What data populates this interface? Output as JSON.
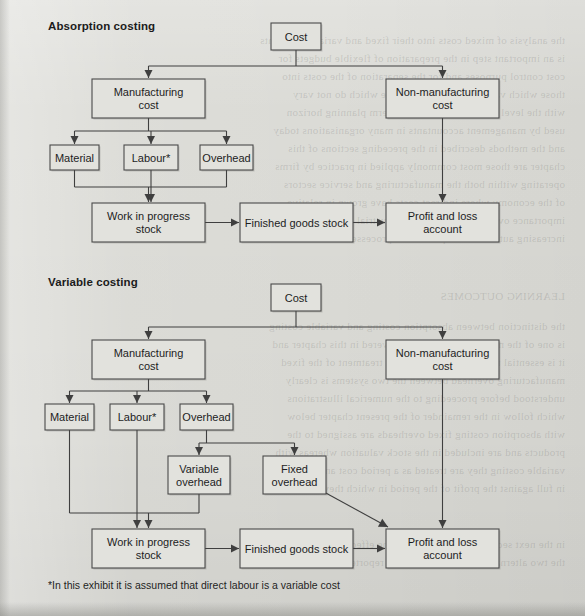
{
  "page": {
    "width": 585,
    "height": 616,
    "background_color": "#dbdbd6",
    "box_fill_color": "#e2e2dd",
    "box_stroke_color": "#4a4a4a",
    "text_color": "#1d1d1d"
  },
  "sections": {
    "absorption": {
      "title": "Absorption costing",
      "title_pos": {
        "x": 48,
        "y": 31
      }
    },
    "variable": {
      "title": "Variable costing",
      "title_pos": {
        "x": 48,
        "y": 287
      }
    }
  },
  "footnote": {
    "text": "*In this exhibit it is assumed that direct labour is a variable cost",
    "pos": {
      "x": 48,
      "y": 590
    }
  },
  "diagram": {
    "absorption_nodes": [
      {
        "id": "abs-cost",
        "label": "Cost",
        "lines": [
          "Cost"
        ],
        "x": 271,
        "y": 23,
        "w": 50,
        "h": 27
      },
      {
        "id": "abs-manufacturing",
        "label": "Manufacturing cost",
        "lines": [
          "Manufacturing",
          "cost"
        ],
        "x": 92,
        "y": 79,
        "w": 113,
        "h": 39
      },
      {
        "id": "abs-nonmanufacturing",
        "label": "Non-manufacturing cost",
        "lines": [
          "Non-manufacturing",
          "cost"
        ],
        "x": 386,
        "y": 79,
        "w": 113,
        "h": 39
      },
      {
        "id": "abs-material",
        "label": "Material",
        "lines": [
          "Material"
        ],
        "x": 50,
        "y": 145,
        "w": 49,
        "h": 25
      },
      {
        "id": "abs-labour",
        "label": "Labour*",
        "lines": [
          "Labour*"
        ],
        "x": 124,
        "y": 145,
        "w": 54,
        "h": 25
      },
      {
        "id": "abs-overhead",
        "label": "Overhead",
        "lines": [
          "Overhead"
        ],
        "x": 200,
        "y": 145,
        "w": 53,
        "h": 25
      },
      {
        "id": "abs-wip",
        "label": "Work in progress stock",
        "lines": [
          "Work in progress",
          "stock"
        ],
        "x": 92,
        "y": 203,
        "w": 113,
        "h": 39
      },
      {
        "id": "abs-finished",
        "label": "Finished goods stock",
        "lines": [
          "Finished goods stock"
        ],
        "x": 240,
        "y": 203,
        "w": 113,
        "h": 39
      },
      {
        "id": "abs-profitloss",
        "label": "Profit and loss account",
        "lines": [
          "Profit and loss",
          "account"
        ],
        "x": 386,
        "y": 203,
        "w": 113,
        "h": 39
      }
    ],
    "variable_nodes": [
      {
        "id": "var-cost",
        "label": "Cost",
        "lines": [
          "Cost"
        ],
        "x": 271,
        "y": 284,
        "w": 50,
        "h": 27
      },
      {
        "id": "var-manufacturing",
        "label": "Manufacturing cost",
        "lines": [
          "Manufacturing",
          "cost"
        ],
        "x": 92,
        "y": 340,
        "w": 113,
        "h": 39
      },
      {
        "id": "var-nonmanufacturing",
        "label": "Non-manufacturing cost",
        "lines": [
          "Non-manufacturing",
          "cost"
        ],
        "x": 386,
        "y": 340,
        "w": 113,
        "h": 39
      },
      {
        "id": "var-material",
        "label": "Material",
        "lines": [
          "Material"
        ],
        "x": 45,
        "y": 404,
        "w": 49,
        "h": 26
      },
      {
        "id": "var-labour",
        "label": "Labour*",
        "lines": [
          "Labour*"
        ],
        "x": 110,
        "y": 404,
        "w": 54,
        "h": 26
      },
      {
        "id": "var-overhead",
        "label": "Overhead",
        "lines": [
          "Overhead"
        ],
        "x": 180,
        "y": 404,
        "w": 53,
        "h": 26
      },
      {
        "id": "var-variable-oh",
        "label": "Variable overhead",
        "lines": [
          "Variable",
          "overhead"
        ],
        "x": 168,
        "y": 456,
        "w": 62,
        "h": 38
      },
      {
        "id": "var-fixed-oh",
        "label": "Fixed overhead",
        "lines": [
          "Fixed",
          "overhead"
        ],
        "x": 263,
        "y": 456,
        "w": 63,
        "h": 38
      },
      {
        "id": "var-wip",
        "label": "Work in progress stock",
        "lines": [
          "Work in progress",
          "stock"
        ],
        "x": 92,
        "y": 529,
        "w": 113,
        "h": 39
      },
      {
        "id": "var-finished",
        "label": "Finished goods stock",
        "lines": [
          "Finished goods stock"
        ],
        "x": 240,
        "y": 529,
        "w": 113,
        "h": 39
      },
      {
        "id": "var-profitloss",
        "label": "Profit and loss account",
        "lines": [
          "Profit and loss",
          "account"
        ],
        "x": 386,
        "y": 529,
        "w": 113,
        "h": 39
      }
    ],
    "absorption_edges": [
      {
        "from": "abs-cost",
        "to": "abs-manufacturing"
      },
      {
        "from": "abs-cost",
        "to": "abs-nonmanufacturing"
      },
      {
        "from": "abs-manufacturing",
        "to": "abs-material"
      },
      {
        "from": "abs-manufacturing",
        "to": "abs-labour"
      },
      {
        "from": "abs-manufacturing",
        "to": "abs-overhead"
      },
      {
        "from": "abs-material",
        "to": "abs-wip"
      },
      {
        "from": "abs-labour",
        "to": "abs-wip"
      },
      {
        "from": "abs-overhead",
        "to": "abs-wip"
      },
      {
        "from": "abs-wip",
        "to": "abs-finished"
      },
      {
        "from": "abs-finished",
        "to": "abs-profitloss"
      },
      {
        "from": "abs-nonmanufacturing",
        "to": "abs-profitloss"
      }
    ],
    "variable_edges": [
      {
        "from": "var-cost",
        "to": "var-manufacturing"
      },
      {
        "from": "var-cost",
        "to": "var-nonmanufacturing"
      },
      {
        "from": "var-manufacturing",
        "to": "var-material"
      },
      {
        "from": "var-manufacturing",
        "to": "var-labour"
      },
      {
        "from": "var-manufacturing",
        "to": "var-overhead"
      },
      {
        "from": "var-overhead",
        "to": "var-variable-oh"
      },
      {
        "from": "var-overhead",
        "to": "var-fixed-oh"
      },
      {
        "from": "var-material",
        "to": "var-wip"
      },
      {
        "from": "var-labour",
        "to": "var-wip"
      },
      {
        "from": "var-variable-oh",
        "to": "var-wip"
      },
      {
        "from": "var-wip",
        "to": "var-finished"
      },
      {
        "from": "var-finished",
        "to": "var-profitloss"
      },
      {
        "from": "var-fixed-oh",
        "to": "var-profitloss"
      },
      {
        "from": "var-nonmanufacturing",
        "to": "var-profitloss"
      }
    ]
  }
}
